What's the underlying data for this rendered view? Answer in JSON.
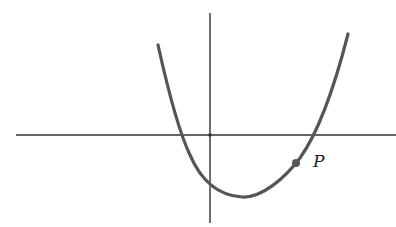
{
  "diagram": {
    "point_label": "P",
    "colors": {
      "curve": "#555555",
      "axes": "#333333",
      "background": "#ffffff"
    }
  }
}
